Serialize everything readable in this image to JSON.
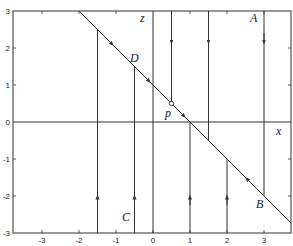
{
  "figure": {
    "type": "phase-portrait",
    "x_axis_label": "x",
    "z_axis_label": "z",
    "xlim": [
      -3.4,
      3.75
    ],
    "ylim": [
      -3,
      3
    ],
    "x_ticks": [
      "-3",
      "-2",
      "-1",
      "0",
      "1",
      "2",
      "3"
    ],
    "y_ticks": [
      "3",
      "2",
      "1",
      "0",
      "-1",
      "-2",
      "-3"
    ],
    "critical_line": {
      "equation": "z = 1 - x",
      "description": "slow manifold, flow directed toward p"
    },
    "point_labels": {
      "A": "A",
      "B": "B",
      "C": "C",
      "D": "D",
      "p": "p"
    },
    "trajectories": [
      {
        "x": -1.5,
        "from": "bottom",
        "direction": "up"
      },
      {
        "x": -0.5,
        "from": "bottom",
        "direction": "up"
      },
      {
        "x": 0.5,
        "from": "top",
        "direction": "down"
      },
      {
        "x": 1.0,
        "from": "bottom",
        "direction": "up"
      },
      {
        "x": 1.5,
        "from": "top",
        "direction": "down"
      },
      {
        "x": 2.0,
        "from": "bottom",
        "direction": "up"
      },
      {
        "x": 3.0,
        "from": "top",
        "direction": "down"
      }
    ],
    "line_color": "#333333"
  }
}
